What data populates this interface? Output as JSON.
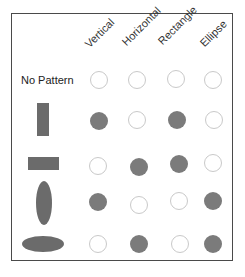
{
  "colors": {
    "filled": "#7b7b7b",
    "empty_outline": "#c9c9c9",
    "shape_fill": "#6b6b6b",
    "frame": "#4a4a4a"
  },
  "columns": [
    {
      "label": "Vertical"
    },
    {
      "label": "Horizontal"
    },
    {
      "label": "Rectangle"
    },
    {
      "label": "Ellipse"
    }
  ],
  "rows": [
    {
      "label": "No Pattern",
      "icon": "none",
      "cells": [
        "empty",
        "empty",
        "empty",
        "empty"
      ]
    },
    {
      "label": "",
      "icon": "vertical-rectangle-icon",
      "cells": [
        "filled",
        "empty",
        "filled",
        "empty"
      ]
    },
    {
      "label": "",
      "icon": "horizontal-rectangle-icon",
      "cells": [
        "empty",
        "filled",
        "filled",
        "empty"
      ]
    },
    {
      "label": "",
      "icon": "vertical-ellipse-icon",
      "cells": [
        "filled",
        "empty",
        "empty",
        "filled"
      ]
    },
    {
      "label": "",
      "icon": "horizontal-ellipse-icon",
      "cells": [
        "empty",
        "filled",
        "empty",
        "filled"
      ]
    }
  ]
}
